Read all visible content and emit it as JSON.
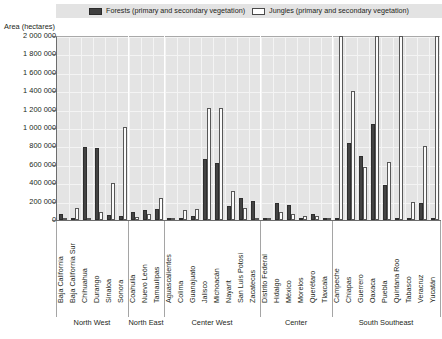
{
  "legend": {
    "entries": [
      {
        "icon": "legend-swatch-dark",
        "label": "Forests (primary and secondary vegetation)",
        "color": "#3f3f3f"
      },
      {
        "icon": "legend-swatch-light",
        "label": "Jungles (primary and secondary vegetation)",
        "color": "#ffffff"
      }
    ]
  },
  "chart_data": {
    "type": "bar",
    "title": "",
    "subtitle": "",
    "xlabel": "",
    "ylabel": "Area (hectares)",
    "ylim": [
      0,
      2000000
    ],
    "ytick_labels": [
      "2 000 000",
      "1 800 000",
      "1 600 000",
      "1 400 000",
      "1 200 000",
      "1 000 000",
      "800 000",
      "600 000",
      "400 000",
      "200 000",
      "0"
    ],
    "ytick_values": [
      2000000,
      1800000,
      1600000,
      1400000,
      1200000,
      1000000,
      800000,
      600000,
      400000,
      200000,
      0
    ],
    "grid": true,
    "legend_position": "top",
    "categories": [
      "Baja California",
      "Baja California Sur",
      "Chihuahua",
      "Durango",
      "Sinaloa",
      "Sonora",
      "Coahuila",
      "Nuevo León",
      "Tamaulipas",
      "Aguascalientes",
      "Colima",
      "Guanajuato",
      "Jalisco",
      "Michoacán",
      "Nayarit",
      "San Luis Potosí",
      "Zacatecas",
      "Distrito Federal",
      "Hidalgo",
      "México",
      "Morelos",
      "Querétaro",
      "Tlaxcala",
      "Campeche",
      "Chiapas",
      "Guerrero",
      "Oaxaca",
      "Puebla",
      "Quintana Roo",
      "Tabasco",
      "Veracruz",
      "Yucatán"
    ],
    "series": [
      {
        "name": "Forests (primary and secondary vegetation)",
        "color": "#434343",
        "values": [
          60000,
          20000,
          790000,
          780000,
          55000,
          40000,
          90000,
          110000,
          120000,
          25000,
          20000,
          40000,
          660000,
          620000,
          150000,
          240000,
          210000,
          20000,
          180000,
          160000,
          20000,
          70000,
          15000,
          10000,
          840000,
          700000,
          1040000,
          380000,
          10000,
          5000,
          180000,
          5000
        ]
      },
      {
        "name": "Jungles (primary and secondary vegetation)",
        "color": "#fbfbfb",
        "values": [
          10000,
          130000,
          20000,
          85000,
          400000,
          1010000,
          30000,
          60000,
          240000,
          20000,
          110000,
          115000,
          1215000,
          1215000,
          310000,
          130000,
          15000,
          10000,
          90000,
          65000,
          40000,
          40000,
          5000,
          2000000,
          1400000,
          580000,
          2000000,
          630000,
          2000000,
          200000,
          800000,
          2000000
        ]
      }
    ],
    "regions": [
      {
        "name": "North West",
        "start": 0,
        "end": 5
      },
      {
        "name": "North East",
        "start": 6,
        "end": 8
      },
      {
        "name": "Center West",
        "start": 9,
        "end": 16
      },
      {
        "name": "Center",
        "start": 17,
        "end": 22
      },
      {
        "name": "South Southeast",
        "start": 23,
        "end": 31
      }
    ]
  }
}
